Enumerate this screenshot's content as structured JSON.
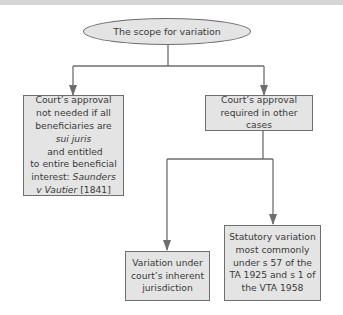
{
  "diagram": {
    "root": {
      "label": "The scope for variation"
    },
    "left_branch": {
      "lines": [
        "Court’s approval",
        "not needed if all",
        "beneficiaries are"
      ],
      "line4_italic": "sui juris",
      "line4_rest": " and entitled",
      "line5": "to entire beneficial",
      "line6_plain": "interest: ",
      "line6_italic": "Saunders",
      "line7_italic": "v Vautier",
      "line7_rest": " [1841]"
    },
    "right_branch": {
      "label": "Court’s approval\nrequired in other cases"
    },
    "right_children": [
      {
        "label": "Variation under\ncourt’s inherent\njurisdiction"
      },
      {
        "label": "Statutory variation\nmost commonly\nunder s 57 of the\nTA 1925 and s 1 of\nthe VTA 1958"
      }
    ],
    "colors": {
      "node_fill": "#e4e4e4",
      "node_border": "#6e6e6e",
      "connector": "#6e6e6e",
      "top_band": "#d6d6d6"
    }
  }
}
